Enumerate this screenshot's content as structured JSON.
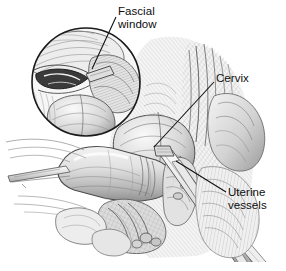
{
  "figure": {
    "kind": "surgical-anatomical-illustration",
    "style": "grayscale pen-and-ink crosshatch drawing",
    "width": 286,
    "height": 271,
    "background_color": "#ffffff",
    "ink_color": "#1a1a1a",
    "shading_color": "#8d8d8d",
    "light_tissue_color": "#e8e8e8",
    "mid_tissue_color": "#bdbdbd",
    "dark_tissue_color": "#6b6b6b"
  },
  "labels": {
    "fascial_window": "Fascial\nwindow",
    "cervix": "Cervix",
    "uterine_vessels": "Uterine\nvessels"
  },
  "inset": {
    "name": "magnified-circular-inset",
    "center_x": 86,
    "center_y": 82,
    "radius": 55,
    "border_color": "#1a1a1a",
    "border_width": 1.6
  },
  "leaders": {
    "fascial_window": {
      "x1": 116,
      "y1": 17,
      "x2": 92,
      "y2": 69
    },
    "cervix": {
      "x1": 214,
      "y1": 82,
      "x2": 154,
      "y2": 147
    },
    "uterine_vessels": {
      "x1": 226,
      "y1": 192,
      "x2": 176,
      "y2": 161
    }
  }
}
